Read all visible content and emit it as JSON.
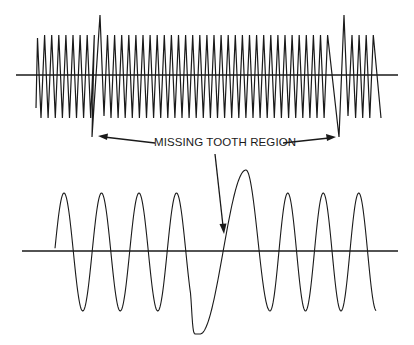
{
  "diagram": {
    "annotation": "MISSING TOOTH REGION",
    "colors": {
      "ink": "#1a1a1a",
      "background": "#ffffff"
    },
    "top_signal": {
      "description": "Raw sawtooth/triangle sensor waveform with two missing-tooth gaps",
      "baseline_y": 75,
      "baseline_x": [
        16,
        398
      ],
      "start_x": 36,
      "end_x": 381,
      "normal_peak_y": 35,
      "normal_trough_y": 118,
      "gap_1": {
        "peak_x": 100,
        "peak_y": 15,
        "trough_x": 92,
        "trough_y": 137
      },
      "gap_2": {
        "peak_x": 344,
        "peak_y": 15,
        "trough_x": 339,
        "trough_y": 137
      }
    },
    "bottom_signal": {
      "description": "Conditioned sine waveform with stretched cycle at missing tooth",
      "baseline_y": 251,
      "baseline_x": [
        22,
        398
      ],
      "cycles_before_gap": 4,
      "cycles_after_gap": 4,
      "peak_y": 193,
      "trough_y": 311,
      "gap_peak": {
        "x": 246,
        "y": 170
      },
      "gap_trough": {
        "x": 200,
        "y": 334
      }
    }
  }
}
